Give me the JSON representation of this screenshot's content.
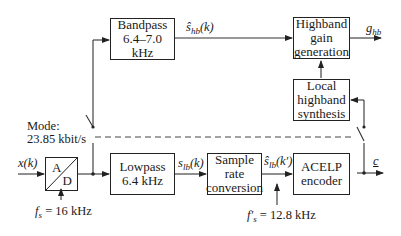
{
  "blocks": {
    "bandpass": {
      "line1": "Bandpass",
      "line2": "6.4–7.0 kHz"
    },
    "highband_gain": {
      "line1": "Highband",
      "line2": "gain",
      "line3": "generation"
    },
    "local_synth": {
      "line1": "Local",
      "line2": "highband",
      "line3": "synthesis"
    },
    "ad": {
      "top": "A",
      "bottom": "D"
    },
    "lowpass": {
      "line1": "Lowpass",
      "line2": "6.4 kHz"
    },
    "src": {
      "line1": "Sample",
      "line2": "rate",
      "line3": "conversion"
    },
    "acelp": {
      "line1": "ACELP",
      "line2": "encoder"
    }
  },
  "labels": {
    "mode_line1": "Mode:",
    "mode_line2": "23.85 kbit/s",
    "input": "x(k)",
    "shb_base": "ŝ",
    "shb_sub": "hb",
    "shb_arg": "(k)",
    "ghb_base": "g",
    "ghb_sub": "hb",
    "slb_base": "s",
    "slb_sub": "lb",
    "slb_arg": "(k)",
    "slb2_base": "ŝ",
    "slb2_sub": "lb",
    "slb2_arg": "(k′)",
    "output": "c",
    "fs_base": "f",
    "fs_sub": "s",
    "fs_value": " = 16 kHz",
    "fs2_base": "f′",
    "fs2_sub": "s",
    "fs2_value": " = 12.8 kHz"
  }
}
